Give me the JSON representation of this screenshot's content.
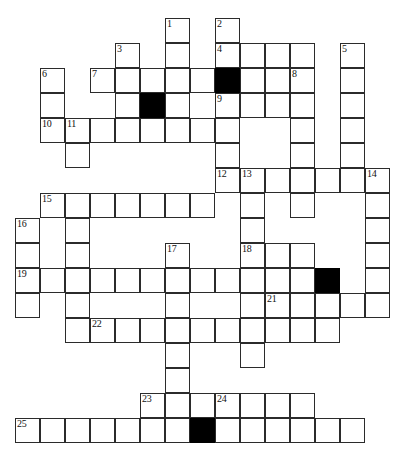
{
  "puzzle": {
    "type": "crossword-grid",
    "title": "Crossword Puzzle Grid",
    "canvas": {
      "width": 416,
      "height": 459
    },
    "geometry": {
      "cell_size": 25,
      "origin_x": 15,
      "origin_y": 18,
      "columns": 15,
      "rows": 17
    },
    "colors": {
      "background": "#ffffff",
      "cell_fill": "#ffffff",
      "cell_border": "#2b2b2b",
      "block_fill": "#000000",
      "number_color": "#111111"
    },
    "counts": {
      "numbered_clues": 25,
      "blocked_cells": 4,
      "open_cells": 121
    },
    "clue_numbers": [
      {
        "number": "1",
        "col": 6,
        "row": 0
      },
      {
        "number": "2",
        "col": 8,
        "row": 0
      },
      {
        "number": "3",
        "col": 4,
        "row": 1
      },
      {
        "number": "4",
        "col": 8,
        "row": 1
      },
      {
        "number": "5",
        "col": 13,
        "row": 1
      },
      {
        "number": "6",
        "col": 1,
        "row": 2
      },
      {
        "number": "7",
        "col": 3,
        "row": 2
      },
      {
        "number": "8",
        "col": 11,
        "row": 2
      },
      {
        "number": "9",
        "col": 8,
        "row": 3
      },
      {
        "number": "10",
        "col": 1,
        "row": 4
      },
      {
        "number": "11",
        "col": 2,
        "row": 4
      },
      {
        "number": "12",
        "col": 8,
        "row": 6
      },
      {
        "number": "13",
        "col": 9,
        "row": 6
      },
      {
        "number": "14",
        "col": 14,
        "row": 6
      },
      {
        "number": "15",
        "col": 1,
        "row": 7
      },
      {
        "number": "16",
        "col": 0,
        "row": 8
      },
      {
        "number": "17",
        "col": 6,
        "row": 9
      },
      {
        "number": "18",
        "col": 9,
        "row": 9
      },
      {
        "number": "19",
        "col": 0,
        "row": 10
      },
      {
        "number": "20",
        "col": 12,
        "row": 10
      },
      {
        "number": "21",
        "col": 10,
        "row": 11
      },
      {
        "number": "22",
        "col": 3,
        "row": 12
      },
      {
        "number": "23",
        "col": 5,
        "row": 15
      },
      {
        "number": "24",
        "col": 8,
        "row": 15
      },
      {
        "number": "25",
        "col": 0,
        "row": 16
      }
    ],
    "blocked_cells": [
      {
        "col": 8,
        "row": 2
      },
      {
        "col": 5,
        "row": 3
      },
      {
        "col": 12,
        "row": 10
      },
      {
        "col": 7,
        "row": 16
      }
    ],
    "cells": [
      {
        "col": 6,
        "row": 0
      },
      {
        "col": 8,
        "row": 0
      },
      {
        "col": 4,
        "row": 1
      },
      {
        "col": 6,
        "row": 1
      },
      {
        "col": 8,
        "row": 1
      },
      {
        "col": 9,
        "row": 1
      },
      {
        "col": 10,
        "row": 1
      },
      {
        "col": 11,
        "row": 1
      },
      {
        "col": 13,
        "row": 1
      },
      {
        "col": 1,
        "row": 2
      },
      {
        "col": 3,
        "row": 2
      },
      {
        "col": 4,
        "row": 2
      },
      {
        "col": 5,
        "row": 2
      },
      {
        "col": 6,
        "row": 2
      },
      {
        "col": 7,
        "row": 2
      },
      {
        "col": 8,
        "row": 2
      },
      {
        "col": 9,
        "row": 2
      },
      {
        "col": 10,
        "row": 2
      },
      {
        "col": 11,
        "row": 2
      },
      {
        "col": 13,
        "row": 2
      },
      {
        "col": 1,
        "row": 3
      },
      {
        "col": 4,
        "row": 3
      },
      {
        "col": 5,
        "row": 3
      },
      {
        "col": 6,
        "row": 3
      },
      {
        "col": 8,
        "row": 3
      },
      {
        "col": 9,
        "row": 3
      },
      {
        "col": 10,
        "row": 3
      },
      {
        "col": 11,
        "row": 3
      },
      {
        "col": 13,
        "row": 3
      },
      {
        "col": 1,
        "row": 4
      },
      {
        "col": 2,
        "row": 4
      },
      {
        "col": 3,
        "row": 4
      },
      {
        "col": 4,
        "row": 4
      },
      {
        "col": 5,
        "row": 4
      },
      {
        "col": 6,
        "row": 4
      },
      {
        "col": 7,
        "row": 4
      },
      {
        "col": 8,
        "row": 4
      },
      {
        "col": 11,
        "row": 4
      },
      {
        "col": 13,
        "row": 4
      },
      {
        "col": 2,
        "row": 5
      },
      {
        "col": 8,
        "row": 5
      },
      {
        "col": 11,
        "row": 5
      },
      {
        "col": 13,
        "row": 5
      },
      {
        "col": 8,
        "row": 6
      },
      {
        "col": 9,
        "row": 6
      },
      {
        "col": 10,
        "row": 6
      },
      {
        "col": 11,
        "row": 6
      },
      {
        "col": 12,
        "row": 6
      },
      {
        "col": 13,
        "row": 6
      },
      {
        "col": 14,
        "row": 6
      },
      {
        "col": 1,
        "row": 7
      },
      {
        "col": 2,
        "row": 7
      },
      {
        "col": 3,
        "row": 7
      },
      {
        "col": 4,
        "row": 7
      },
      {
        "col": 5,
        "row": 7
      },
      {
        "col": 6,
        "row": 7
      },
      {
        "col": 7,
        "row": 7
      },
      {
        "col": 9,
        "row": 7
      },
      {
        "col": 11,
        "row": 7
      },
      {
        "col": 14,
        "row": 7
      },
      {
        "col": 0,
        "row": 8
      },
      {
        "col": 2,
        "row": 8
      },
      {
        "col": 9,
        "row": 8
      },
      {
        "col": 14,
        "row": 8
      },
      {
        "col": 0,
        "row": 9
      },
      {
        "col": 2,
        "row": 9
      },
      {
        "col": 6,
        "row": 9
      },
      {
        "col": 9,
        "row": 9
      },
      {
        "col": 10,
        "row": 9
      },
      {
        "col": 11,
        "row": 9
      },
      {
        "col": 14,
        "row": 9
      },
      {
        "col": 0,
        "row": 10
      },
      {
        "col": 1,
        "row": 10
      },
      {
        "col": 2,
        "row": 10
      },
      {
        "col": 3,
        "row": 10
      },
      {
        "col": 4,
        "row": 10
      },
      {
        "col": 5,
        "row": 10
      },
      {
        "col": 6,
        "row": 10
      },
      {
        "col": 7,
        "row": 10
      },
      {
        "col": 8,
        "row": 10
      },
      {
        "col": 9,
        "row": 10
      },
      {
        "col": 10,
        "row": 10
      },
      {
        "col": 11,
        "row": 10
      },
      {
        "col": 12,
        "row": 10
      },
      {
        "col": 14,
        "row": 10
      },
      {
        "col": 0,
        "row": 11
      },
      {
        "col": 2,
        "row": 11
      },
      {
        "col": 6,
        "row": 11
      },
      {
        "col": 9,
        "row": 11
      },
      {
        "col": 10,
        "row": 11
      },
      {
        "col": 11,
        "row": 11
      },
      {
        "col": 12,
        "row": 11
      },
      {
        "col": 13,
        "row": 11
      },
      {
        "col": 14,
        "row": 11
      },
      {
        "col": 2,
        "row": 12
      },
      {
        "col": 3,
        "row": 12
      },
      {
        "col": 4,
        "row": 12
      },
      {
        "col": 5,
        "row": 12
      },
      {
        "col": 6,
        "row": 12
      },
      {
        "col": 7,
        "row": 12
      },
      {
        "col": 8,
        "row": 12
      },
      {
        "col": 9,
        "row": 12
      },
      {
        "col": 10,
        "row": 12
      },
      {
        "col": 11,
        "row": 12
      },
      {
        "col": 12,
        "row": 12
      },
      {
        "col": 6,
        "row": 13
      },
      {
        "col": 9,
        "row": 13
      },
      {
        "col": 6,
        "row": 14
      },
      {
        "col": 5,
        "row": 15
      },
      {
        "col": 6,
        "row": 15
      },
      {
        "col": 7,
        "row": 15
      },
      {
        "col": 8,
        "row": 15
      },
      {
        "col": 9,
        "row": 15
      },
      {
        "col": 10,
        "row": 15
      },
      {
        "col": 11,
        "row": 15
      },
      {
        "col": 0,
        "row": 16
      },
      {
        "col": 1,
        "row": 16
      },
      {
        "col": 2,
        "row": 16
      },
      {
        "col": 3,
        "row": 16
      },
      {
        "col": 4,
        "row": 16
      },
      {
        "col": 5,
        "row": 16
      },
      {
        "col": 6,
        "row": 16
      },
      {
        "col": 7,
        "row": 16
      },
      {
        "col": 8,
        "row": 16
      },
      {
        "col": 9,
        "row": 16
      },
      {
        "col": 10,
        "row": 16
      },
      {
        "col": 11,
        "row": 16
      },
      {
        "col": 12,
        "row": 16
      },
      {
        "col": 13,
        "row": 16
      }
    ]
  }
}
